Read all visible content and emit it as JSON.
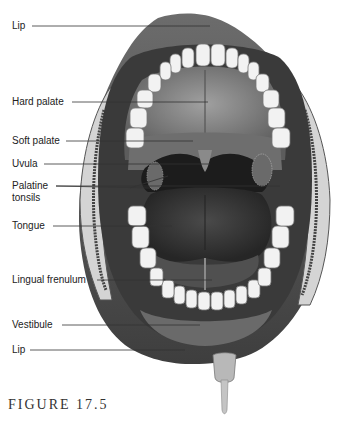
{
  "figure": {
    "caption": "FIGURE 17.5"
  },
  "labels": [
    {
      "id": "lip-upper",
      "text": "Lip",
      "x": 12,
      "y": 20
    },
    {
      "id": "hard-palate",
      "text": "Hard palate",
      "x": 12,
      "y": 96
    },
    {
      "id": "soft-palate",
      "text": "Soft palate",
      "x": 12,
      "y": 135
    },
    {
      "id": "uvula",
      "text": "Uvula",
      "x": 12,
      "y": 158
    },
    {
      "id": "palatine-tonsils-1",
      "text": "Palatine",
      "x": 12,
      "y": 180
    },
    {
      "id": "palatine-tonsils-2",
      "text": "tonsils",
      "x": 12,
      "y": 192
    },
    {
      "id": "tongue",
      "text": "Tongue",
      "x": 12,
      "y": 220
    },
    {
      "id": "lingual-frenulum",
      "text": "Lingual frenulum",
      "x": 12,
      "y": 274
    },
    {
      "id": "vestibule",
      "text": "Vestibule",
      "x": 12,
      "y": 319
    },
    {
      "id": "lip-lower",
      "text": "Lip",
      "x": 12,
      "y": 344
    }
  ],
  "colors": {
    "lip": "#5a5a5a",
    "lip_dark": "#3a3a3a",
    "teeth": "#f0f0f0",
    "palate": "#7a7a7a",
    "throat": "#1e1e1e",
    "tongue": "#3c3c3c",
    "cheek": "#d8d8d8",
    "line": "#333333"
  }
}
